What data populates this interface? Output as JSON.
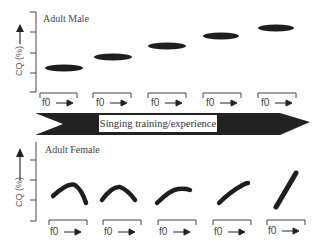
{
  "male_panel": {
    "title": "Adult Male",
    "ylabel": "CQ (%)",
    "xlabel": "f0",
    "shape": "flat ellipse",
    "trend": "CQ level rises with training, flat across f0",
    "subplots": 5
  },
  "banner": {
    "label": "Singing training/experience",
    "color": "#222222"
  },
  "female_panel": {
    "title": "Adult Female",
    "ylabel": "CQ (%)",
    "xlabel": "f0",
    "shape": "inverted-V curve becoming rising diagonal",
    "trend": "CQ-f0 pattern changes from arch to positive slope with training",
    "subplots": 5
  },
  "f0_labels": [
    "f0",
    "f0",
    "f0",
    "f0",
    "f0"
  ]
}
